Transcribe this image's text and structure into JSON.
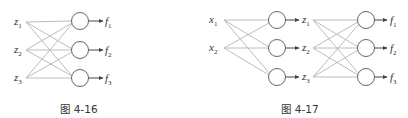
{
  "figures": [
    {
      "id": "fig-4-16",
      "caption": "图 4-16",
      "inputs": [
        {
          "base": "z",
          "sub": "1"
        },
        {
          "base": "z",
          "sub": "2"
        },
        {
          "base": "z",
          "sub": "3"
        }
      ],
      "outputs": [
        {
          "base": "f",
          "sub": "1"
        },
        {
          "base": "f",
          "sub": "2"
        },
        {
          "base": "f",
          "sub": "3"
        }
      ],
      "description": "Fully connected layer: 3 inputs z1..z3 to 3 neurons producing f1..f3"
    },
    {
      "id": "fig-4-17",
      "caption": "图 4-17",
      "inputs": [
        {
          "base": "x",
          "sub": "1"
        },
        {
          "base": "x",
          "sub": "2"
        }
      ],
      "hidden_outputs": [
        {
          "base": "z",
          "sub": "1"
        },
        {
          "base": "z",
          "sub": "2"
        },
        {
          "base": "z",
          "sub": "3"
        }
      ],
      "outputs": [
        {
          "base": "f",
          "sub": "1"
        },
        {
          "base": "f",
          "sub": "2"
        },
        {
          "base": "f",
          "sub": "3"
        }
      ],
      "description": "Two-layer network: 2 inputs x1,x2 to 3 neurons producing z1..z3, fully connected to 3 neurons producing f1..f3"
    }
  ],
  "colors": {
    "edge": "#b5b5b5",
    "node_stroke": "#666666",
    "text": "#333333"
  }
}
